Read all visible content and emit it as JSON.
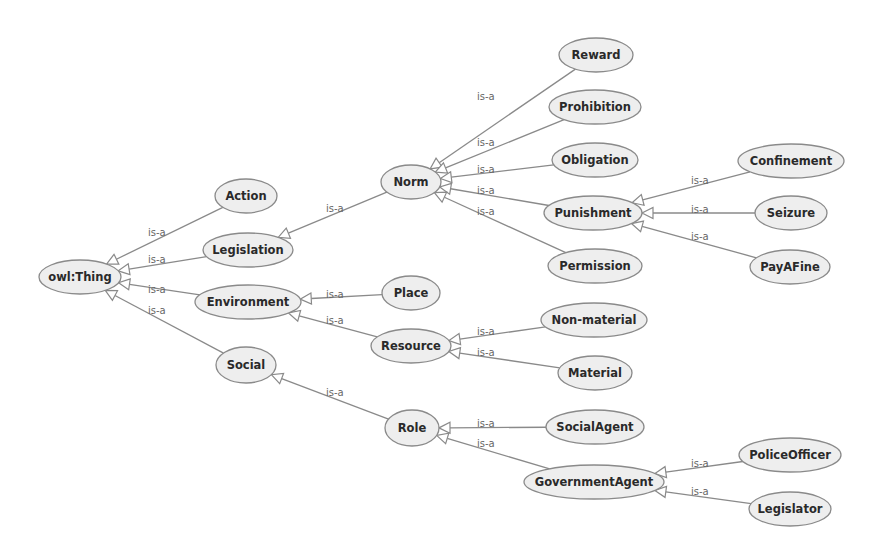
{
  "diagram": {
    "type": "ontology-class-hierarchy",
    "edge_label": "is-a",
    "colors": {
      "node_fill": "#eeeeee",
      "node_stroke": "#8a8a8a",
      "edge": "#8a8a8a",
      "label_text": "#2a2a2a",
      "edge_text": "#666666"
    },
    "nodes": [
      {
        "id": "owlThing",
        "label": "owl:Thing",
        "x": 80,
        "y": 277,
        "rx": 41,
        "ry": 17
      },
      {
        "id": "Action",
        "label": "Action",
        "x": 246,
        "y": 196,
        "rx": 31,
        "ry": 17
      },
      {
        "id": "Legislation",
        "label": "Legislation",
        "x": 248,
        "y": 250,
        "rx": 45,
        "ry": 17
      },
      {
        "id": "Environment",
        "label": "Environment",
        "x": 248,
        "y": 302,
        "rx": 53,
        "ry": 17
      },
      {
        "id": "Social",
        "label": "Social",
        "x": 246,
        "y": 365,
        "rx": 30,
        "ry": 18
      },
      {
        "id": "Norm",
        "label": "Norm",
        "x": 411,
        "y": 182,
        "rx": 30,
        "ry": 17
      },
      {
        "id": "Place",
        "label": "Place",
        "x": 411,
        "y": 293,
        "rx": 29,
        "ry": 17
      },
      {
        "id": "Resource",
        "label": "Resource",
        "x": 411,
        "y": 346,
        "rx": 40,
        "ry": 17
      },
      {
        "id": "Role",
        "label": "Role",
        "x": 412,
        "y": 428,
        "rx": 27,
        "ry": 18
      },
      {
        "id": "Reward",
        "label": "Reward",
        "x": 596,
        "y": 55,
        "rx": 37,
        "ry": 17
      },
      {
        "id": "Prohibition",
        "label": "Prohibition",
        "x": 595,
        "y": 107,
        "rx": 46,
        "ry": 17
      },
      {
        "id": "Obligation",
        "label": "Obligation",
        "x": 595,
        "y": 160,
        "rx": 43,
        "ry": 17
      },
      {
        "id": "Punishment",
        "label": "Punishment",
        "x": 593,
        "y": 213,
        "rx": 49,
        "ry": 17
      },
      {
        "id": "Permission",
        "label": "Permission",
        "x": 595,
        "y": 266,
        "rx": 47,
        "ry": 17
      },
      {
        "id": "Confinement",
        "label": "Confinement",
        "x": 791,
        "y": 161,
        "rx": 53,
        "ry": 17
      },
      {
        "id": "Seizure",
        "label": "Seizure",
        "x": 791,
        "y": 213,
        "rx": 36,
        "ry": 17
      },
      {
        "id": "PayAFine",
        "label": "PayAFine",
        "x": 790,
        "y": 267,
        "rx": 40,
        "ry": 17
      },
      {
        "id": "NonMaterial",
        "label": "Non-material",
        "x": 594,
        "y": 320,
        "rx": 53,
        "ry": 17
      },
      {
        "id": "Material",
        "label": "Material",
        "x": 595,
        "y": 373,
        "rx": 37,
        "ry": 17
      },
      {
        "id": "SocialAgent",
        "label": "SocialAgent",
        "x": 595,
        "y": 427,
        "rx": 49,
        "ry": 17
      },
      {
        "id": "GovernmentAgent",
        "label": "GovernmentAgent",
        "x": 594,
        "y": 482,
        "rx": 70,
        "ry": 17
      },
      {
        "id": "PoliceOfficer",
        "label": "PoliceOfficer",
        "x": 790,
        "y": 455,
        "rx": 51,
        "ry": 17
      },
      {
        "id": "Legislator",
        "label": "Legislator",
        "x": 790,
        "y": 509,
        "rx": 41,
        "ry": 17
      }
    ],
    "edges": [
      {
        "from": "Action",
        "to": "owlThing",
        "label": "is-a",
        "lx": 148,
        "ly": 236
      },
      {
        "from": "Legislation",
        "to": "owlThing",
        "label": "is-a",
        "lx": 148,
        "ly": 263
      },
      {
        "from": "Environment",
        "to": "owlThing",
        "label": "is-a",
        "lx": 148,
        "ly": 293
      },
      {
        "from": "Social",
        "to": "owlThing",
        "label": "is-a",
        "lx": 148,
        "ly": 314
      },
      {
        "from": "Norm",
        "to": "Legislation",
        "label": "is-a",
        "lx": 326,
        "ly": 212
      },
      {
        "from": "Place",
        "to": "Environment",
        "label": "is-a",
        "lx": 326,
        "ly": 298
      },
      {
        "from": "Resource",
        "to": "Environment",
        "label": "is-a",
        "lx": 326,
        "ly": 324
      },
      {
        "from": "Role",
        "to": "Social",
        "label": "is-a",
        "lx": 326,
        "ly": 396
      },
      {
        "from": "Reward",
        "to": "Norm",
        "label": "is-a",
        "lx": 477,
        "ly": 100
      },
      {
        "from": "Prohibition",
        "to": "Norm",
        "label": "is-a",
        "lx": 477,
        "ly": 146
      },
      {
        "from": "Obligation",
        "to": "Norm",
        "label": "is-a",
        "lx": 477,
        "ly": 173
      },
      {
        "from": "Punishment",
        "to": "Norm",
        "label": "is-a",
        "lx": 477,
        "ly": 194
      },
      {
        "from": "Permission",
        "to": "Norm",
        "label": "is-a",
        "lx": 477,
        "ly": 215
      },
      {
        "from": "Confinement",
        "to": "Punishment",
        "label": "is-a",
        "lx": 691,
        "ly": 184
      },
      {
        "from": "Seizure",
        "to": "Punishment",
        "label": "is-a",
        "lx": 691,
        "ly": 213
      },
      {
        "from": "PayAFine",
        "to": "Punishment",
        "label": "is-a",
        "lx": 691,
        "ly": 240
      },
      {
        "from": "NonMaterial",
        "to": "Resource",
        "label": "is-a",
        "lx": 477,
        "ly": 335
      },
      {
        "from": "Material",
        "to": "Resource",
        "label": "is-a",
        "lx": 477,
        "ly": 356
      },
      {
        "from": "SocialAgent",
        "to": "Role",
        "label": "is-a",
        "lx": 477,
        "ly": 427
      },
      {
        "from": "GovernmentAgent",
        "to": "Role",
        "label": "is-a",
        "lx": 477,
        "ly": 447
      },
      {
        "from": "PoliceOfficer",
        "to": "GovernmentAgent",
        "label": "is-a",
        "lx": 691,
        "ly": 467
      },
      {
        "from": "Legislator",
        "to": "GovernmentAgent",
        "label": "is-a",
        "lx": 691,
        "ly": 495
      }
    ]
  }
}
